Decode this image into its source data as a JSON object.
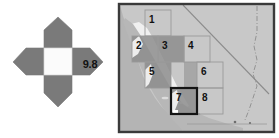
{
  "figure": {
    "background_color": "#ffffff",
    "panels": [
      "compass-panel",
      "map-panel"
    ]
  },
  "compass": {
    "name": "directional-diamond",
    "value_label": "9.8",
    "arm_color": "#7a7a7a",
    "center_color": "#fbfbfb",
    "outline_color": "#8f8f8f",
    "arms": [
      {
        "direction": "north",
        "name": "north-arm"
      },
      {
        "direction": "east",
        "name": "east-arm"
      },
      {
        "direction": "south",
        "name": "south-arm"
      },
      {
        "direction": "west",
        "name": "west-arm"
      }
    ]
  },
  "map": {
    "name": "california-region-map",
    "frame_color": "#3a3a3a",
    "land_color": "#c9c9c9",
    "ocean_color": "#b9b9b9",
    "coast_color": "#f2f2f2",
    "highlight_color": "#8d8d8d",
    "grid_line_color": "#9a9a9a",
    "selected_cell_outline": "#1a1a1a",
    "selected_cell": "7",
    "cells": [
      {
        "id": "1",
        "label": "1",
        "x": 28,
        "y": 8,
        "w": 26,
        "h": 26,
        "shaded": false,
        "selected": false
      },
      {
        "id": "2",
        "label": "2",
        "x": 15,
        "y": 34,
        "w": 26,
        "h": 26,
        "shaded": true,
        "selected": false
      },
      {
        "id": "3",
        "label": "3",
        "x": 41,
        "y": 34,
        "w": 26,
        "h": 26,
        "shaded": true,
        "selected": false
      },
      {
        "id": "4",
        "label": "4",
        "x": 67,
        "y": 34,
        "w": 26,
        "h": 26,
        "shaded": false,
        "selected": false
      },
      {
        "id": "5",
        "label": "5",
        "x": 28,
        "y": 60,
        "w": 26,
        "h": 26,
        "shaded": true,
        "selected": false
      },
      {
        "id": "6",
        "label": "6",
        "x": 80,
        "y": 60,
        "w": 26,
        "h": 26,
        "shaded": false,
        "selected": false
      },
      {
        "id": "7",
        "label": "7",
        "x": 54,
        "y": 86,
        "w": 26,
        "h": 26,
        "shaded": true,
        "selected": true
      },
      {
        "id": "8",
        "label": "8",
        "x": 80,
        "y": 86,
        "w": 26,
        "h": 26,
        "shaded": false,
        "selected": false
      }
    ],
    "cell_labels": [
      {
        "id": "1",
        "text": "1",
        "left": 32,
        "top": 12
      },
      {
        "id": "2",
        "text": "2",
        "left": 19,
        "top": 38
      },
      {
        "id": "3",
        "text": "3",
        "left": 45,
        "top": 38
      },
      {
        "id": "4",
        "text": "4",
        "left": 71,
        "top": 38
      },
      {
        "id": "5",
        "text": "5",
        "left": 32,
        "top": 64
      },
      {
        "id": "6",
        "text": "6",
        "left": 84,
        "top": 64
      },
      {
        "id": "7",
        "text": "7",
        "left": 58,
        "top": 90
      },
      {
        "id": "8",
        "text": "8",
        "left": 84,
        "top": 90
      }
    ]
  }
}
